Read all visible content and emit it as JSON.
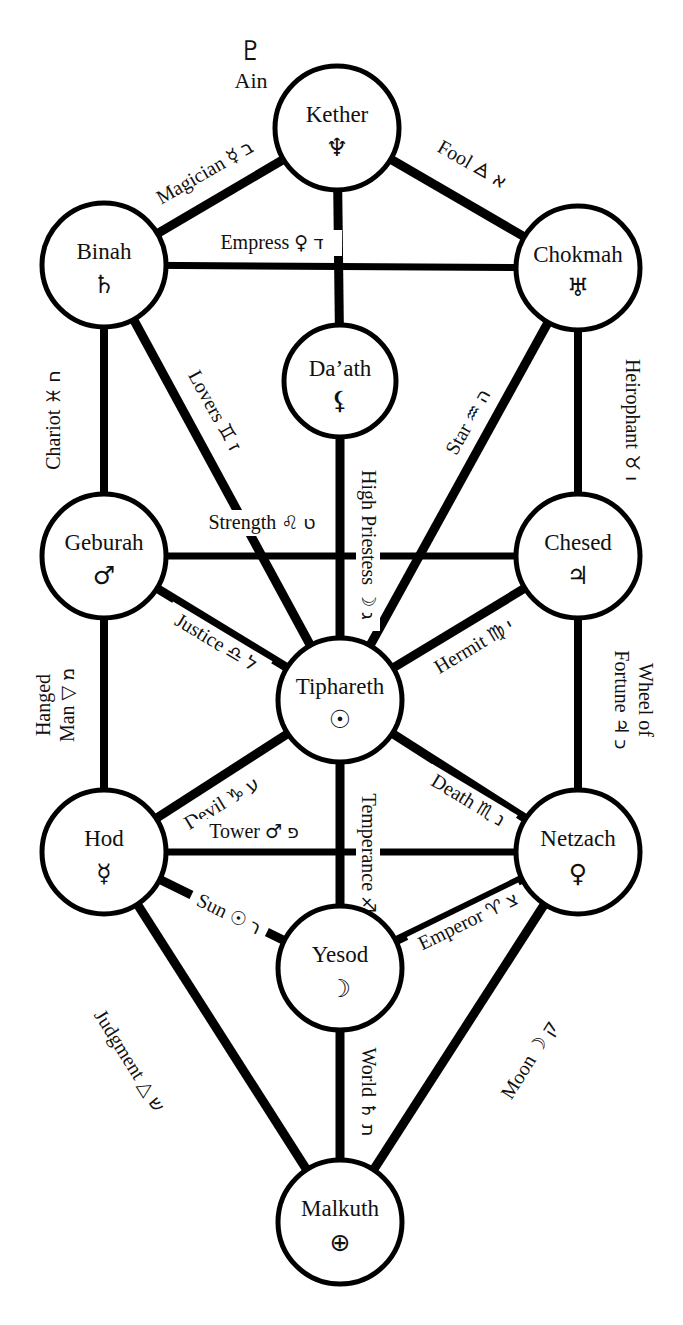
{
  "diagram": {
    "caption": "",
    "line_color": "#000000",
    "background_color": "#ffffff",
    "text_color": "#111111"
  },
  "veil": {
    "label": "Ain",
    "glyph": "♇",
    "glyph_name": "pluto-symbol"
  },
  "sephiroth": [
    {
      "id": "kether",
      "name": "Kether",
      "glyph": "♆",
      "glyph_name": "neptune-symbol",
      "cx": 337,
      "cy": 128,
      "r": 62
    },
    {
      "id": "binah",
      "name": "Binah",
      "glyph": "♄",
      "glyph_name": "saturn-symbol",
      "cx": 104,
      "cy": 265,
      "r": 62
    },
    {
      "id": "chokmah",
      "name": "Chokmah",
      "glyph": "♅",
      "glyph_name": "uranus-symbol",
      "cx": 578,
      "cy": 268,
      "r": 62
    },
    {
      "id": "daath",
      "name": "Da’ath",
      "glyph": "⚸",
      "glyph_name": "lilith-symbol",
      "cx": 340,
      "cy": 381,
      "r": 56
    },
    {
      "id": "geburah",
      "name": "Geburah",
      "glyph": "♂",
      "glyph_name": "mars-symbol",
      "cx": 104,
      "cy": 556,
      "r": 62
    },
    {
      "id": "chesed",
      "name": "Chesed",
      "glyph": "♃",
      "glyph_name": "jupiter-symbol",
      "cx": 578,
      "cy": 556,
      "r": 62
    },
    {
      "id": "tiphareth",
      "name": "Tiphareth",
      "glyph": "☉",
      "glyph_name": "sun-symbol",
      "cx": 340,
      "cy": 700,
      "r": 62
    },
    {
      "id": "hod",
      "name": "Hod",
      "glyph": "☿",
      "glyph_name": "mercury-symbol",
      "cx": 104,
      "cy": 852,
      "r": 62
    },
    {
      "id": "netzach",
      "name": "Netzach",
      "glyph": "♀",
      "glyph_name": "venus-symbol",
      "cx": 578,
      "cy": 852,
      "r": 62
    },
    {
      "id": "yesod",
      "name": "Yesod",
      "glyph": "☽",
      "glyph_name": "moon-symbol",
      "cx": 340,
      "cy": 968,
      "r": 62
    },
    {
      "id": "malkuth",
      "name": "Malkuth",
      "glyph": "⊕",
      "glyph_name": "earth-symbol",
      "cx": 340,
      "cy": 1222,
      "r": 62
    }
  ],
  "paths": [
    {
      "id": "magician",
      "tarot": "Magician",
      "astro": "☿",
      "hebrew": "ב",
      "from": "kether",
      "to": "binah",
      "label_x": 207,
      "label_y": 176,
      "angle": -30
    },
    {
      "id": "fool",
      "tarot": "Fool",
      "astro": "🜁",
      "hebrew": "א",
      "from": "kether",
      "to": "chokmah",
      "label_x": 470,
      "label_y": 168,
      "angle": 30
    },
    {
      "id": "empress",
      "tarot": "Empress",
      "astro": "♀",
      "hebrew": "ד",
      "from": "binah",
      "to": "chokmah",
      "label_x": 270,
      "label_y": 248,
      "angle": 0
    },
    {
      "id": "chariot",
      "tarot": "Chariot",
      "astro": "♓",
      "hebrew": "ח",
      "from": "binah",
      "to": "geburah",
      "label_x": 58,
      "label_y": 420,
      "angle": -90
    },
    {
      "id": "lovers",
      "tarot": "Lovers",
      "astro": "♊",
      "hebrew": "ז",
      "from": "binah",
      "to": "tiphareth",
      "label_x": 209,
      "label_y": 410,
      "angle": 60
    },
    {
      "id": "heirophant",
      "tarot": "Heirophant",
      "astro": "♉",
      "hebrew": "ו",
      "from": "chokmah",
      "to": "chesed",
      "label_x": 628,
      "label_y": 420,
      "angle": 90
    },
    {
      "id": "star",
      "tarot": "Star",
      "astro": "♒",
      "hebrew": "ה",
      "from": "chokmah",
      "to": "tiphareth",
      "label_x": 470,
      "label_y": 420,
      "angle": -60
    },
    {
      "id": "high-priestess",
      "tarot": "High Priestess",
      "astro": "☽",
      "hebrew": "ג",
      "from": "kether",
      "to": "tiphareth",
      "label_x": 363,
      "label_y": 540,
      "angle": 90
    },
    {
      "id": "strength",
      "tarot": "Strength",
      "astro": "♌",
      "hebrew": "ט",
      "from": "geburah",
      "to": "chesed",
      "label_x": 260,
      "label_y": 527,
      "angle": 0
    },
    {
      "id": "justice",
      "tarot": "Justice",
      "astro": "♎",
      "hebrew": "ל",
      "from": "geburah",
      "to": "tiphareth",
      "label_x": 213,
      "label_y": 644,
      "angle": 30
    },
    {
      "id": "hermit",
      "tarot": "Hermit",
      "astro": "♍",
      "hebrew": "י",
      "from": "chesed",
      "to": "tiphareth",
      "label_x": 475,
      "label_y": 648,
      "angle": -30
    },
    {
      "id": "hanged-man",
      "tarot": "Hanged Man",
      "astro": "▽",
      "hebrew": "מ",
      "from": "geburah",
      "to": "hod",
      "label_x": 57,
      "label_y": 705,
      "angle": -90
    },
    {
      "id": "wheel",
      "tarot": "Wheel of Fortune",
      "astro": "♃",
      "hebrew": "כ",
      "from": "chesed",
      "to": "netzach",
      "label_x": 630,
      "label_y": 700,
      "angle": 90
    },
    {
      "id": "devil",
      "tarot": "Devil",
      "astro": "♑",
      "hebrew": "ע",
      "from": "hod",
      "to": "tiphareth",
      "label_x": 222,
      "label_y": 806,
      "angle": -30
    },
    {
      "id": "death",
      "tarot": "Death",
      "astro": "♏",
      "hebrew": "נ",
      "from": "netzach",
      "to": "tiphareth",
      "label_x": 466,
      "label_y": 803,
      "angle": 30
    },
    {
      "id": "tower",
      "tarot": "Tower",
      "astro": "♂",
      "hebrew": "פ",
      "from": "hod",
      "to": "netzach",
      "label_x": 252,
      "label_y": 836,
      "angle": 0
    },
    {
      "id": "temperance",
      "tarot": "Temperance",
      "astro": "♐",
      "hebrew": "ס",
      "from": "tiphareth",
      "to": "yesod",
      "label_x": 363,
      "label_y": 858,
      "angle": 90
    },
    {
      "id": "sun",
      "tarot": "Sun",
      "astro": "☉",
      "hebrew": "ר",
      "from": "hod",
      "to": "yesod",
      "label_x": 225,
      "label_y": 917,
      "angle": 30
    },
    {
      "id": "emperor",
      "tarot": "Emperor",
      "astro": "♈",
      "hebrew": "צ",
      "from": "netzach",
      "to": "yesod",
      "label_x": 468,
      "label_y": 925,
      "angle": -30
    },
    {
      "id": "judgment",
      "tarot": "Judgment",
      "astro": "△",
      "hebrew": "ש",
      "from": "hod",
      "to": "malkuth",
      "label_x": 128,
      "label_y": 1063,
      "angle": 60
    },
    {
      "id": "moon",
      "tarot": "Moon",
      "astro": "☽",
      "hebrew": "ק",
      "from": "netzach",
      "to": "malkuth",
      "label_x": 530,
      "label_y": 1063,
      "angle": -60
    },
    {
      "id": "world",
      "tarot": "World",
      "astro": "♄",
      "hebrew": "ת",
      "from": "yesod",
      "to": "malkuth",
      "label_x": 363,
      "label_y": 1092,
      "angle": 90
    },
    {
      "id": "daath-upper",
      "tarot": "",
      "astro": "",
      "hebrew": "",
      "from": "kether",
      "to": "daath",
      "label_x": 0,
      "label_y": 0,
      "angle": 0
    }
  ]
}
